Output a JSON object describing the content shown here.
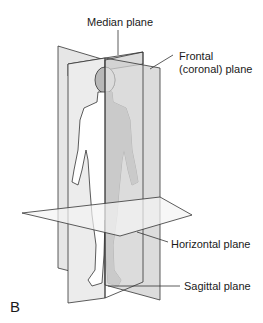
{
  "figure_label": "B",
  "labels": {
    "median": "Median plane",
    "frontal_line1": "Frontal",
    "frontal_line2": "(coronal) plane",
    "horizontal": "Horizontal plane",
    "sagittal": "Sagittal plane"
  },
  "colors": {
    "plane_light": "#e6e6e6",
    "plane_dark": "#c9c9c9",
    "horizontal_plane": "#f2f2f2",
    "body_fill": "#ffffff",
    "body_shaded": "#b8b8b8",
    "line": "#333333"
  }
}
